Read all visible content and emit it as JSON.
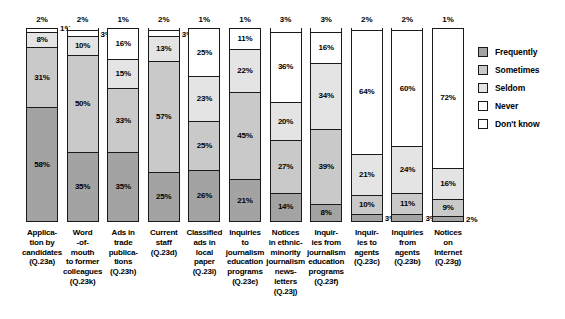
{
  "legend": {
    "position": "right",
    "items": [
      {
        "label": "Frequently",
        "color": "#a3a3a3"
      },
      {
        "label": "Sometimes",
        "color": "#c9c9c9"
      },
      {
        "label": "Seldom",
        "color": "#e4e4e4"
      },
      {
        "label": "Never",
        "color": "#ffffff"
      },
      {
        "label": "Don't know",
        "color": "#ffffff"
      }
    ]
  },
  "chart_data": {
    "type": "bar",
    "title": "",
    "subtitle": "",
    "xlabel": "",
    "ylabel": "",
    "ylim": [
      0,
      100
    ],
    "grid": false,
    "stacked": true,
    "stack_order_bottom_to_top": [
      "Frequently",
      "Sometimes",
      "Seldom",
      "Never",
      "Don't know"
    ],
    "categories": [
      "Application by candidates (Q.23a)",
      "Word-of-mouth to former colleagues (Q.23k)",
      "Ads in trade publications (Q.23h)",
      "Current staff (Q.23d)",
      "Classified ads in local paper (Q.23i)",
      "Inquiries to journalism education programs (Q.23e)",
      "Notices in ethnic-minority journalism news-letters (Q.23j)",
      "Inquiries from journalism education programs (Q.23f)",
      "Inquiries to agents (Q.23c)",
      "Inquiries from agents (Q.23b)",
      "Notices on Internet (Q.23g)"
    ],
    "category_lines": [
      [
        "Applica-",
        "tion by",
        "candidates",
        "(Q.23a)"
      ],
      [
        "Word",
        "-of-",
        "mouth",
        "to former",
        "colleagues",
        "(Q.23k)"
      ],
      [
        "Ads in",
        "trade",
        "publica-",
        "tions",
        "(Q.23h)"
      ],
      [
        "Current",
        "staff",
        "(Q.23d)"
      ],
      [
        "Classified",
        "ads in",
        "local",
        "paper",
        "(Q.23i)"
      ],
      [
        "Inquiries",
        "to",
        "journalism",
        "education",
        "programs",
        "(Q.23e)"
      ],
      [
        "Notices",
        "in ethnic-",
        "minority",
        "journalism",
        "news-",
        "letters",
        "(Q.23j)"
      ],
      [
        "Inquir-",
        "ies from",
        "journalism",
        "education",
        "programs",
        "(Q.23f)"
      ],
      [
        "Inquir-",
        "ies to",
        "agents",
        "(Q.23c)"
      ],
      [
        "Inquiries",
        "from",
        "agents",
        "(Q.23b)"
      ],
      [
        "Notices",
        "on",
        "Internet",
        "(Q.23g)"
      ]
    ],
    "series": [
      {
        "name": "Frequently",
        "values": [
          58,
          35,
          35,
          25,
          26,
          21,
          14,
          8,
          3,
          3,
          2
        ]
      },
      {
        "name": "Sometimes",
        "values": [
          31,
          50,
          33,
          57,
          25,
          45,
          27,
          39,
          10,
          11,
          9
        ]
      },
      {
        "name": "Seldom",
        "values": [
          8,
          10,
          15,
          13,
          23,
          22,
          20,
          34,
          21,
          24,
          16
        ]
      },
      {
        "name": "Never",
        "values": [
          2,
          3,
          16,
          3,
          25,
          11,
          36,
          16,
          64,
          60,
          72
        ]
      },
      {
        "name": "Don't know",
        "values": [
          1,
          2,
          1,
          2,
          1,
          1,
          3,
          3,
          2,
          2,
          1
        ]
      }
    ],
    "bars": [
      {
        "category_key": "Application by candidates (Q.23a)",
        "segments": [
          {
            "name": "Frequently",
            "value": 58,
            "label": "58%",
            "label_pos": "inside"
          },
          {
            "name": "Sometimes",
            "value": 31,
            "label": "31%",
            "label_pos": "inside"
          },
          {
            "name": "Seldom",
            "value": 8,
            "label": "8%",
            "label_pos": "inside"
          },
          {
            "name": "Never",
            "value": 2,
            "label": "2%",
            "label_pos": "above"
          },
          {
            "name": "Don't know",
            "value": 1,
            "label": "1%",
            "label_pos": "right"
          }
        ]
      },
      {
        "category_key": "Word-of-mouth to former colleagues (Q.23k)",
        "segments": [
          {
            "name": "Frequently",
            "value": 35,
            "label": "35%",
            "label_pos": "inside"
          },
          {
            "name": "Sometimes",
            "value": 50,
            "label": "50%",
            "label_pos": "inside"
          },
          {
            "name": "Seldom",
            "value": 10,
            "label": "10%",
            "label_pos": "inside"
          },
          {
            "name": "Never",
            "value": 3,
            "label": "3%",
            "label_pos": "right"
          },
          {
            "name": "Don't know",
            "value": 2,
            "label": "2%",
            "label_pos": "above"
          }
        ]
      },
      {
        "category_key": "Ads in trade publications (Q.23h)",
        "segments": [
          {
            "name": "Frequently",
            "value": 35,
            "label": "35%",
            "label_pos": "inside"
          },
          {
            "name": "Sometimes",
            "value": 33,
            "label": "33%",
            "label_pos": "inside"
          },
          {
            "name": "Seldom",
            "value": 15,
            "label": "15%",
            "label_pos": "inside"
          },
          {
            "name": "Never",
            "value": 16,
            "label": "16%",
            "label_pos": "inside"
          },
          {
            "name": "Don't know",
            "value": 1,
            "label": "1%",
            "label_pos": "above"
          }
        ]
      },
      {
        "category_key": "Current staff (Q.23d)",
        "segments": [
          {
            "name": "Frequently",
            "value": 25,
            "label": "25%",
            "label_pos": "inside"
          },
          {
            "name": "Sometimes",
            "value": 57,
            "label": "57%",
            "label_pos": "inside"
          },
          {
            "name": "Seldom",
            "value": 13,
            "label": "13%",
            "label_pos": "inside"
          },
          {
            "name": "Never",
            "value": 3,
            "label": "3%",
            "label_pos": "right"
          },
          {
            "name": "Don't know",
            "value": 2,
            "label": "2%",
            "label_pos": "above"
          }
        ]
      },
      {
        "category_key": "Classified ads in local paper (Q.23i)",
        "segments": [
          {
            "name": "Frequently",
            "value": 26,
            "label": "26%",
            "label_pos": "inside"
          },
          {
            "name": "Sometimes",
            "value": 25,
            "label": "25%",
            "label_pos": "inside"
          },
          {
            "name": "Seldom",
            "value": 23,
            "label": "23%",
            "label_pos": "inside"
          },
          {
            "name": "Never",
            "value": 25,
            "label": "25%",
            "label_pos": "inside"
          },
          {
            "name": "Don't know",
            "value": 1,
            "label": "1%",
            "label_pos": "above"
          }
        ]
      },
      {
        "category_key": "Inquiries to journalism education programs (Q.23e)",
        "segments": [
          {
            "name": "Frequently",
            "value": 21,
            "label": "21%",
            "label_pos": "inside"
          },
          {
            "name": "Sometimes",
            "value": 45,
            "label": "45%",
            "label_pos": "inside"
          },
          {
            "name": "Seldom",
            "value": 22,
            "label": "22%",
            "label_pos": "inside"
          },
          {
            "name": "Never",
            "value": 11,
            "label": "11%",
            "label_pos": "inside"
          },
          {
            "name": "Don't know",
            "value": 1,
            "label": "1%",
            "label_pos": "above"
          }
        ]
      },
      {
        "category_key": "Notices in ethnic-minority journalism news-letters (Q.23j)",
        "segments": [
          {
            "name": "Frequently",
            "value": 14,
            "label": "14%",
            "label_pos": "inside"
          },
          {
            "name": "Sometimes",
            "value": 27,
            "label": "27%",
            "label_pos": "inside"
          },
          {
            "name": "Seldom",
            "value": 20,
            "label": "20%",
            "label_pos": "inside"
          },
          {
            "name": "Never",
            "value": 36,
            "label": "36%",
            "label_pos": "inside"
          },
          {
            "name": "Don't know",
            "value": 3,
            "label": "3%",
            "label_pos": "above"
          }
        ]
      },
      {
        "category_key": "Inquiries from journalism education programs (Q.23f)",
        "segments": [
          {
            "name": "Frequently",
            "value": 8,
            "label": "8%",
            "label_pos": "inside"
          },
          {
            "name": "Sometimes",
            "value": 39,
            "label": "39%",
            "label_pos": "inside"
          },
          {
            "name": "Seldom",
            "value": 34,
            "label": "34%",
            "label_pos": "inside"
          },
          {
            "name": "Never",
            "value": 16,
            "label": "16%",
            "label_pos": "inside"
          },
          {
            "name": "Don't know",
            "value": 3,
            "label": "3%",
            "label_pos": "above"
          }
        ]
      },
      {
        "category_key": "Inquiries to agents (Q.23c)",
        "segments": [
          {
            "name": "Frequently",
            "value": 3,
            "label": "3%",
            "label_pos": "right"
          },
          {
            "name": "Sometimes",
            "value": 10,
            "label": "10%",
            "label_pos": "inside"
          },
          {
            "name": "Seldom",
            "value": 21,
            "label": "21%",
            "label_pos": "inside"
          },
          {
            "name": "Never",
            "value": 64,
            "label": "64%",
            "label_pos": "inside"
          },
          {
            "name": "Don't know",
            "value": 2,
            "label": "2%",
            "label_pos": "above"
          }
        ]
      },
      {
        "category_key": "Inquiries from agents (Q.23b)",
        "segments": [
          {
            "name": "Frequently",
            "value": 3,
            "label": "3%",
            "label_pos": "right"
          },
          {
            "name": "Sometimes",
            "value": 11,
            "label": "11%",
            "label_pos": "inside"
          },
          {
            "name": "Seldom",
            "value": 24,
            "label": "24%",
            "label_pos": "inside"
          },
          {
            "name": "Never",
            "value": 60,
            "label": "60%",
            "label_pos": "inside"
          },
          {
            "name": "Don't know",
            "value": 2,
            "label": "2%",
            "label_pos": "above"
          }
        ]
      },
      {
        "category_key": "Notices on Internet (Q.23g)",
        "segments": [
          {
            "name": "Frequently",
            "value": 2,
            "label": "2%",
            "label_pos": "right"
          },
          {
            "name": "Sometimes",
            "value": 9,
            "label": "9%",
            "label_pos": "inside"
          },
          {
            "name": "Seldom",
            "value": 16,
            "label": "16%",
            "label_pos": "inside"
          },
          {
            "name": "Never",
            "value": 72,
            "label": "72%",
            "label_pos": "inside"
          },
          {
            "name": "Don't know",
            "value": 1,
            "label": "1%",
            "label_pos": "above"
          }
        ]
      }
    ]
  }
}
